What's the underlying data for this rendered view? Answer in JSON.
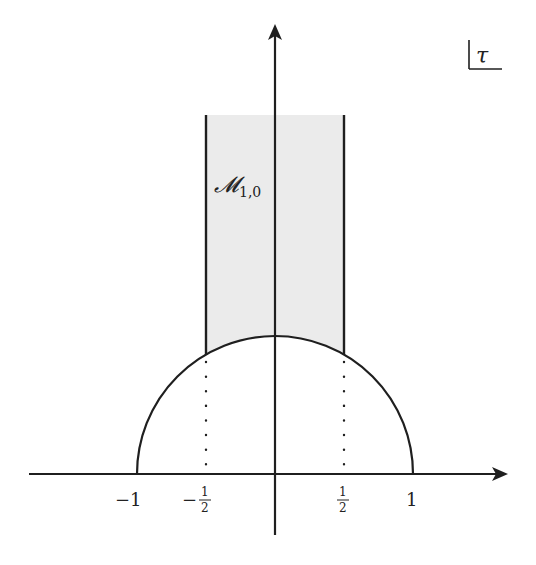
{
  "diagram": {
    "colors": {
      "line": "#1f1f1f",
      "shade": "#ebebeb",
      "background": "#ffffff"
    },
    "plane_label": "τ",
    "region_label": {
      "main": "𝓜",
      "subscript": "1,0"
    },
    "tick_labels": {
      "neg_one": "−1",
      "neg_half_sign": "−",
      "neg_half_num": "1",
      "neg_half_den": "2",
      "pos_half_num": "1",
      "pos_half_den": "2",
      "pos_one": "1"
    },
    "geometry": {
      "origin": [
        275,
        474
      ],
      "unit_px": 138,
      "strip_top_y": 115,
      "arc_radius_units": 1,
      "strip_half_width_units": 0.5
    },
    "elements": [
      "horizontal axis (real part) with arrow",
      "vertical axis (imaginary part) with arrow",
      "unit semicircle |τ| = 1",
      "vertical lines Re τ = ±1/2 above the arc",
      "dotted lines from arc to axis at Re τ = ±1/2",
      "shaded region above the arc between Re τ = ±1/2"
    ]
  }
}
